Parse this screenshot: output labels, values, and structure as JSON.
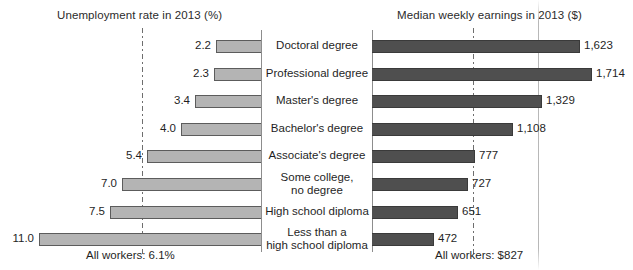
{
  "chart_data": {
    "type": "bar",
    "orientation": "horizontal",
    "layout": "paired bidirectional bar chart sharing centered category labels",
    "grid": false,
    "legend_position": "none",
    "categories": [
      "Doctoral degree",
      "Professional degree",
      "Master's degree",
      "Bachelor's degree",
      "Associate's degree",
      "Some college,\nno degree",
      "High school diploma",
      "Less than a\nhigh school diploma"
    ],
    "series": [
      {
        "name": "Unemployment rate in 2013 (%)",
        "side": "left",
        "unit": "%",
        "values": [
          2.2,
          2.3,
          3.4,
          4.0,
          5.4,
          7.0,
          7.5,
          11.0
        ],
        "labels": [
          "2.2",
          "2.3",
          "3.4",
          "4.0",
          "5.4",
          "7.0",
          "7.5",
          "11.0"
        ],
        "reference_line": {
          "label": "All workers: 6.1%",
          "value": 6.1
        },
        "axis_range": [
          0,
          11.8
        ]
      },
      {
        "name": "Median weekly earnings in 2013 ($)",
        "side": "right",
        "unit": "$",
        "values": [
          1623,
          1714,
          1329,
          1108,
          777,
          727,
          651,
          472
        ],
        "labels": [
          "1,623",
          "1,714",
          "1,329",
          "1,108",
          "777",
          "727",
          "651",
          "472"
        ],
        "reference_line": {
          "label": "All workers: $827",
          "value": 827
        },
        "axis_range": [
          0,
          1800
        ]
      }
    ]
  },
  "left_panel": {
    "title": "Unemployment rate in 2013 (%)",
    "footnote": "All workers: 6.1%",
    "bar_color": "#b4b4b4",
    "bar_border_color": "#5c5c5c"
  },
  "right_panel": {
    "title": "Median weekly earnings in 2013 ($)",
    "footnote": "All workers: $827",
    "bar_color": "#4f4f4f",
    "bar_border_color": "#3a3a3a"
  },
  "rows": [
    {
      "category_line1": "Doctoral degree",
      "category_line2": "",
      "left_label": "2.2",
      "right_label": "1,623",
      "left_bar_start": 216,
      "right_bar_end": 580,
      "left_value_right_edge": 211,
      "right_value_left": 584
    },
    {
      "category_line1": "Professional degree",
      "category_line2": "",
      "left_label": "2.3",
      "right_label": "1,714",
      "left_bar_start": 214,
      "right_bar_end": 592,
      "left_value_right_edge": 209,
      "right_value_left": 596
    },
    {
      "category_line1": "Master's degree",
      "category_line2": "",
      "left_label": "3.4",
      "right_label": "1,329",
      "left_bar_start": 195,
      "right_bar_end": 542,
      "left_value_right_edge": 190,
      "right_value_left": 546
    },
    {
      "category_line1": "Bachelor's degree",
      "category_line2": "",
      "left_label": "4.0",
      "right_label": "1,108",
      "left_bar_start": 181,
      "right_bar_end": 513,
      "left_value_right_edge": 176,
      "right_value_left": 517
    },
    {
      "category_line1": "Associate's degree",
      "category_line2": "",
      "left_label": "5.4",
      "right_label": "777",
      "left_bar_start": 147,
      "right_bar_end": 475,
      "left_value_right_edge": 142,
      "right_value_left": 479
    },
    {
      "category_line1": "Some college,",
      "category_line2": "no degree",
      "left_label": "7.0",
      "right_label": "727",
      "left_bar_start": 122,
      "right_bar_end": 468,
      "left_value_right_edge": 117,
      "right_value_left": 472
    },
    {
      "category_line1": "High school diploma",
      "category_line2": "",
      "left_label": "7.5",
      "right_label": "651",
      "left_bar_start": 110,
      "right_bar_end": 458,
      "left_value_right_edge": 105,
      "right_value_left": 462
    },
    {
      "category_line1": "Less than a",
      "category_line2": "high school diploma",
      "left_label": "11.0",
      "right_label": "472",
      "left_bar_start": 39,
      "right_bar_end": 434,
      "left_value_right_edge": 34,
      "right_value_left": 438
    }
  ]
}
